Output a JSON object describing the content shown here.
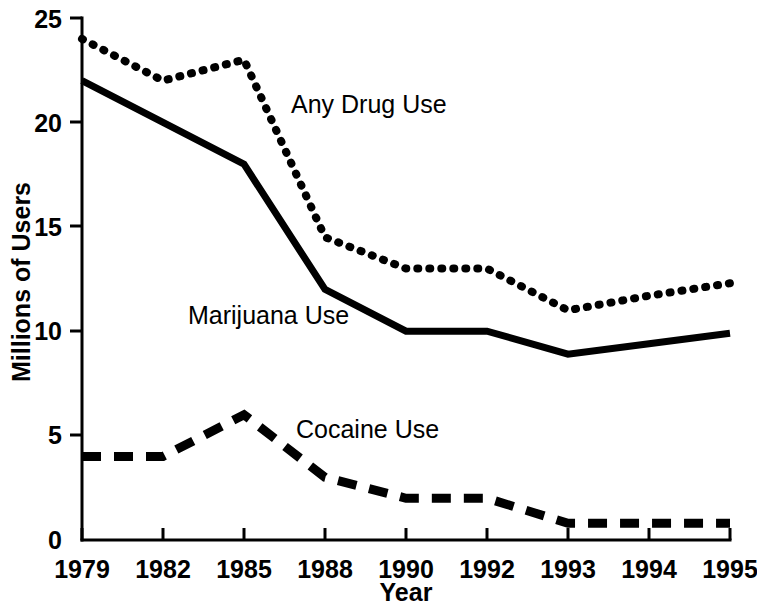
{
  "chart_data": {
    "type": "line",
    "title": "",
    "subtitle": "",
    "xlabel": "Year",
    "ylabel": "Millions of Users",
    "categories": [
      "1979",
      "1982",
      "1985",
      "1988",
      "1990",
      "1992",
      "1993",
      "1994",
      "1995"
    ],
    "x_tick_labels": [
      "1979",
      "1982",
      "1985",
      "1988",
      "1990",
      "1992",
      "1993",
      "1994",
      "1995"
    ],
    "y_tick_labels": [
      "0",
      "5",
      "10",
      "15",
      "20",
      "25"
    ],
    "y_ticks": [
      0,
      5,
      10,
      15,
      20,
      25
    ],
    "ylim": [
      0,
      25
    ],
    "grid": false,
    "legend_position": "inline-annotations",
    "series": [
      {
        "name": "Any Drug Use",
        "style": "dotted",
        "color": "#000000",
        "values": [
          24,
          22,
          23,
          14.5,
          13,
          13,
          11,
          11.7,
          12.3
        ],
        "label_x_frac": 0.385,
        "label_y_value": 21.3
      },
      {
        "name": "Marijuana Use",
        "style": "solid",
        "color": "#000000",
        "values": [
          22,
          20,
          18,
          12,
          10,
          10,
          8.9,
          9.4,
          9.9
        ],
        "label_x_frac": 0.249,
        "label_y_value": 11.2
      },
      {
        "name": "Cocaine Use",
        "style": "dashed",
        "color": "#000000",
        "values": [
          4,
          4,
          6,
          3,
          2,
          2,
          0.8,
          0.8,
          0.8
        ],
        "label_x_frac": 0.39,
        "label_y_value": 5.8
      }
    ],
    "annotations": [
      {
        "text": "Any Drug Use",
        "x": 291,
        "y": 113
      },
      {
        "text": "Marijuana Use",
        "x": 188,
        "y": 324
      },
      {
        "text": "Cocaine Use",
        "x": 296,
        "y": 438
      }
    ]
  },
  "axes": {
    "y_title": "Millions of Users",
    "x_title": "Year",
    "y_labels": [
      "25",
      "20",
      "15",
      "10",
      "5",
      "0"
    ],
    "x_labels": [
      "1979",
      "1982",
      "1985",
      "1988",
      "1990",
      "1992",
      "1993",
      "1994",
      "1995"
    ]
  }
}
